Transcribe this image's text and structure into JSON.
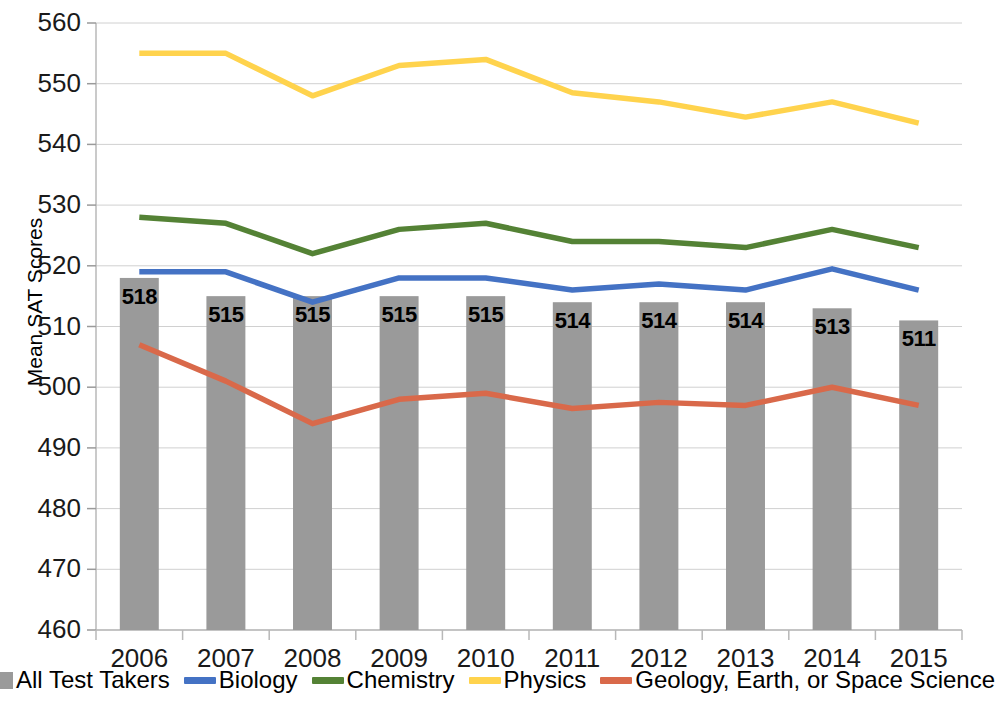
{
  "chart_data": {
    "type": "bar",
    "title": "",
    "xlabel": "",
    "ylabel": "Mean SAT Scores",
    "ylim": [
      460,
      560
    ],
    "ytick_step": 10,
    "yticks": [
      560,
      550,
      540,
      530,
      520,
      510,
      500,
      490,
      480,
      470,
      460
    ],
    "grid": true,
    "legend_position": "bottom",
    "categories": [
      "2006",
      "2007",
      "2008",
      "2009",
      "2010",
      "2011",
      "2012",
      "2013",
      "2014",
      "2015"
    ],
    "series": [
      {
        "name": "All Test Takers",
        "type": "bar",
        "color": "#9a9a9a",
        "values": [
          518,
          515,
          515,
          515,
          515,
          514,
          514,
          514,
          513,
          511
        ],
        "data_labels": [
          "518",
          "515",
          "515",
          "515",
          "515",
          "514",
          "514",
          "514",
          "513",
          "511"
        ]
      },
      {
        "name": "Biology",
        "type": "line",
        "color": "#4472c4",
        "values": [
          519,
          519,
          514,
          518,
          518,
          516,
          517,
          516,
          519.5,
          516
        ]
      },
      {
        "name": "Chemistry",
        "type": "line",
        "color": "#548235",
        "values": [
          528,
          527,
          522,
          526,
          527,
          524,
          524,
          523,
          526,
          523
        ]
      },
      {
        "name": "Physics",
        "type": "line",
        "color": "#ffd34d",
        "values": [
          555,
          555,
          548,
          553,
          554,
          548.5,
          547,
          544.5,
          547,
          543.5
        ]
      },
      {
        "name": "Geology, Earth, or Space Science",
        "type": "line",
        "color": "#d9694a",
        "values": [
          507,
          501,
          494,
          498,
          499,
          496.5,
          497.5,
          497,
          500,
          497
        ]
      }
    ]
  },
  "legend": {
    "items": [
      {
        "label": "All Test Takers",
        "marker": "bar",
        "color": "#9a9a9a"
      },
      {
        "label": "Biology",
        "marker": "line",
        "color": "#4472c4"
      },
      {
        "label": "Chemistry",
        "marker": "line",
        "color": "#548235"
      },
      {
        "label": "Physics",
        "marker": "line",
        "color": "#ffd34d"
      },
      {
        "label": "Geology, Earth, or Space Science",
        "marker": "line",
        "color": "#d9694a"
      }
    ]
  }
}
